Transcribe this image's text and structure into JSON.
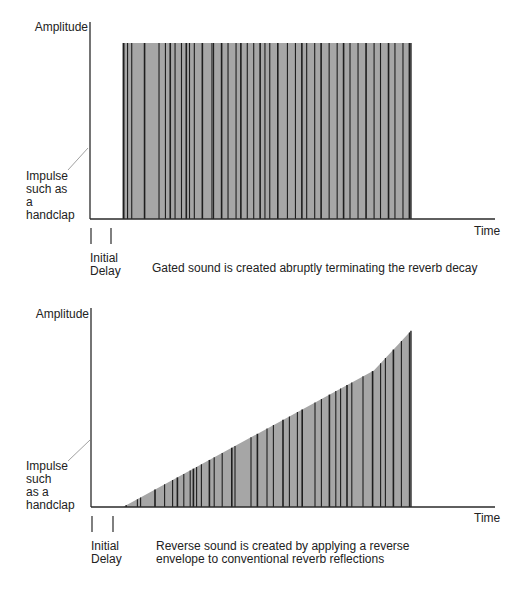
{
  "colors": {
    "fill": "#a6a6a6",
    "line": "#1e1e1e",
    "axis": "#2a2a2a",
    "pointer": "#888888"
  },
  "diagrams": [
    {
      "id": "gated",
      "y_label": "Amplitude",
      "x_label": "Time",
      "impulse_label": [
        "Impulse",
        "such as",
        "a",
        "handclap"
      ],
      "delay_label": [
        "Initial",
        "Delay"
      ],
      "caption": [
        "Gated sound is created abruptly terminating the reverb decay"
      ]
    },
    {
      "id": "reverse",
      "y_label": "Amplitude",
      "x_label": "Time",
      "impulse_label": [
        "Impulse",
        "such",
        "as a",
        "handclap"
      ],
      "delay_label": [
        "Initial",
        "Delay"
      ],
      "caption": [
        "Reverse sound is created by applying a reverse",
        "envelope to conventional reverb reflections"
      ]
    }
  ],
  "chart_data": [
    {
      "type": "area",
      "title": "Gated reverb",
      "xlabel": "Time",
      "ylabel": "Amplitude",
      "envelope": "constant amplitude then abrupt cutoff",
      "envelope_points": [
        [
          0.1,
          1.0
        ],
        [
          1.0,
          1.0
        ]
      ],
      "initial_delay": 0.1,
      "reflections_x": [
        0.105,
        0.117,
        0.13,
        0.17,
        0.215,
        0.235,
        0.25,
        0.265,
        0.285,
        0.3,
        0.31,
        0.325,
        0.35,
        0.38,
        0.385,
        0.41,
        0.43,
        0.455,
        0.47,
        0.49,
        0.51,
        0.53,
        0.545,
        0.56,
        0.585,
        0.615,
        0.64,
        0.66,
        0.675,
        0.7,
        0.72,
        0.745,
        0.77,
        0.79,
        0.81,
        0.835,
        0.86,
        0.885,
        0.905,
        0.93,
        0.95,
        0.975,
        0.995
      ],
      "caption": "Gated sound is created abruptly terminating the reverb decay"
    },
    {
      "type": "area",
      "title": "Reverse reverb",
      "xlabel": "Time",
      "ylabel": "Amplitude",
      "envelope": "rising ramp, steeper near end, abrupt cutoff",
      "envelope_points": [
        [
          0.1,
          0.0
        ],
        [
          0.884,
          0.69
        ],
        [
          1.0,
          0.89
        ]
      ],
      "initial_delay": 0.1,
      "reflections_x": [
        0.11,
        0.145,
        0.155,
        0.2,
        0.23,
        0.255,
        0.27,
        0.29,
        0.31,
        0.32,
        0.33,
        0.345,
        0.37,
        0.385,
        0.41,
        0.44,
        0.45,
        0.5,
        0.52,
        0.55,
        0.57,
        0.6,
        0.62,
        0.645,
        0.66,
        0.7,
        0.72,
        0.745,
        0.765,
        0.78,
        0.8,
        0.815,
        0.85,
        0.88,
        0.905,
        0.92,
        0.945,
        0.97,
        0.995
      ],
      "caption": "Reverse sound is created by applying a reverse envelope to conventional reverb reflections"
    }
  ]
}
